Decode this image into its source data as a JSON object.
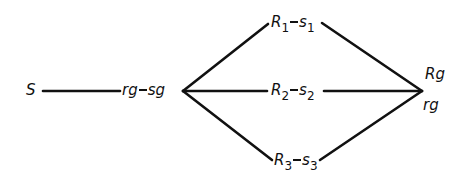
{
  "diagram": {
    "nodes": {
      "source": {
        "label": "S"
      },
      "hub": {
        "left": "rg",
        "right": "sg"
      },
      "branch1": {
        "r": "R",
        "r_sub": "1",
        "s": "s",
        "s_sub": "1"
      },
      "branch2": {
        "r": "R",
        "r_sub": "2",
        "s": "s",
        "s_sub": "2"
      },
      "branch3": {
        "r": "R",
        "r_sub": "3",
        "s": "s",
        "s_sub": "3"
      },
      "sink_top": {
        "label": "Rg"
      },
      "sink_bottom": {
        "label": "rg"
      }
    },
    "edges": [
      {
        "from": "S",
        "to": "rg-sg"
      },
      {
        "from": "rg-sg",
        "to": "R1-s1"
      },
      {
        "from": "rg-sg",
        "to": "R2-s2"
      },
      {
        "from": "rg-sg",
        "to": "R3-s3"
      },
      {
        "from": "R1-s1",
        "to": "Rg/rg"
      },
      {
        "from": "R2-s2",
        "to": "Rg/rg"
      },
      {
        "from": "R3-s3",
        "to": "Rg/rg"
      }
    ],
    "line_color": "#111111"
  }
}
